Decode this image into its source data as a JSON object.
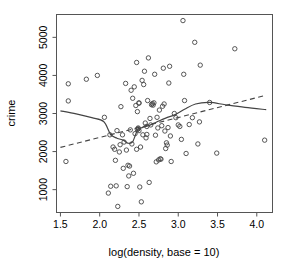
{
  "chart_data": {
    "type": "scatter",
    "title": "",
    "xlabel": "log(density, base = 10)",
    "ylabel": "crime",
    "xlim": [
      1.45,
      4.2
    ],
    "ylim": [
      400,
      5600
    ],
    "xticks": [
      1.5,
      2.0,
      2.5,
      3.0,
      3.5,
      4.0
    ],
    "xtick_labels": [
      "1.5",
      "2.0",
      "2.5",
      "3.0",
      "3.5",
      "4.0"
    ],
    "yticks": [
      1000,
      2000,
      3000,
      4000,
      5000
    ],
    "ytick_labels": [
      "1000",
      "2000",
      "3000",
      "4000",
      "5000"
    ],
    "grid": false,
    "legend": "none",
    "point_marker": "open-circle",
    "point_radius_px": 2.2,
    "points": [
      [
        1.57,
        1740
      ],
      [
        1.6,
        3330
      ],
      [
        1.6,
        3780
      ],
      [
        1.83,
        3900
      ],
      [
        1.97,
        4000
      ],
      [
        2.06,
        2900
      ],
      [
        2.11,
        910
      ],
      [
        2.13,
        2440
      ],
      [
        2.14,
        1090
      ],
      [
        2.17,
        2120
      ],
      [
        2.19,
        2060
      ],
      [
        2.2,
        1770
      ],
      [
        2.21,
        1100
      ],
      [
        2.22,
        2550
      ],
      [
        2.23,
        560
      ],
      [
        2.25,
        1990
      ],
      [
        2.26,
        2180
      ],
      [
        2.27,
        3180
      ],
      [
        2.29,
        2440
      ],
      [
        2.3,
        1560
      ],
      [
        2.31,
        2250
      ],
      [
        2.33,
        3790
      ],
      [
        2.34,
        2040
      ],
      [
        2.35,
        1080
      ],
      [
        2.36,
        1640
      ],
      [
        2.37,
        1360
      ],
      [
        2.38,
        1620
      ],
      [
        2.39,
        2570
      ],
      [
        2.4,
        3610
      ],
      [
        2.41,
        2200
      ],
      [
        2.42,
        3400
      ],
      [
        2.43,
        1430
      ],
      [
        2.44,
        3700
      ],
      [
        2.45,
        2470
      ],
      [
        2.46,
        3210
      ],
      [
        2.47,
        2060
      ],
      [
        2.47,
        4340
      ],
      [
        2.48,
        3050
      ],
      [
        2.48,
        2580
      ],
      [
        2.49,
        2620
      ],
      [
        2.49,
        2600
      ],
      [
        2.5,
        2550
      ],
      [
        2.5,
        3280
      ],
      [
        2.5,
        3270
      ],
      [
        2.51,
        1070
      ],
      [
        2.52,
        2120
      ],
      [
        2.53,
        680
      ],
      [
        2.54,
        3870
      ],
      [
        2.55,
        2440
      ],
      [
        2.56,
        3760
      ],
      [
        2.57,
        4110
      ],
      [
        2.58,
        2750
      ],
      [
        2.59,
        2360
      ],
      [
        2.6,
        2660
      ],
      [
        2.6,
        2450
      ],
      [
        2.61,
        3340
      ],
      [
        2.62,
        4460
      ],
      [
        2.63,
        1190
      ],
      [
        2.64,
        2870
      ],
      [
        2.65,
        2700
      ],
      [
        2.66,
        3230
      ],
      [
        2.67,
        3260
      ],
      [
        2.68,
        3220
      ],
      [
        2.69,
        3280
      ],
      [
        2.7,
        4030
      ],
      [
        2.71,
        2430
      ],
      [
        2.72,
        1730
      ],
      [
        2.73,
        2900
      ],
      [
        2.74,
        2620
      ],
      [
        2.75,
        1780
      ],
      [
        2.76,
        3090
      ],
      [
        2.77,
        1810
      ],
      [
        2.78,
        1800
      ],
      [
        2.79,
        2680
      ],
      [
        2.8,
        3190
      ],
      [
        2.81,
        4190
      ],
      [
        2.82,
        3250
      ],
      [
        2.83,
        2540
      ],
      [
        2.84,
        2080
      ],
      [
        2.85,
        2230
      ],
      [
        2.86,
        2170
      ],
      [
        2.87,
        2630
      ],
      [
        2.88,
        3800
      ],
      [
        2.89,
        4240
      ],
      [
        2.9,
        2410
      ],
      [
        2.91,
        1740
      ],
      [
        2.95,
        3000
      ],
      [
        2.97,
        2890
      ],
      [
        3.0,
        2700
      ],
      [
        3.02,
        2660
      ],
      [
        3.04,
        2320
      ],
      [
        3.06,
        5440
      ],
      [
        3.07,
        4030
      ],
      [
        3.08,
        3340
      ],
      [
        3.1,
        1950
      ],
      [
        3.14,
        2710
      ],
      [
        3.18,
        2890
      ],
      [
        3.21,
        4870
      ],
      [
        3.25,
        2200
      ],
      [
        3.27,
        2780
      ],
      [
        3.28,
        4270
      ],
      [
        3.4,
        3290
      ],
      [
        3.49,
        1960
      ],
      [
        3.72,
        4700
      ],
      [
        4.1,
        2300
      ]
    ],
    "lowess_curve": {
      "style": "solid",
      "points": [
        [
          1.5,
          3070
        ],
        [
          1.7,
          2990
        ],
        [
          1.9,
          2890
        ],
        [
          2.05,
          2790
        ],
        [
          2.14,
          2450
        ],
        [
          2.22,
          2350
        ],
        [
          2.3,
          2300
        ],
        [
          2.36,
          2220
        ],
        [
          2.42,
          2260
        ],
        [
          2.48,
          2560
        ],
        [
          2.54,
          2630
        ],
        [
          2.62,
          2680
        ],
        [
          2.72,
          2770
        ],
        [
          2.84,
          2880
        ],
        [
          2.96,
          2970
        ],
        [
          3.08,
          3110
        ],
        [
          3.22,
          3250
        ],
        [
          3.4,
          3290
        ],
        [
          3.6,
          3230
        ],
        [
          3.85,
          3160
        ],
        [
          4.12,
          3100
        ]
      ]
    },
    "regression_line": {
      "style": "dashed",
      "points": [
        [
          1.5,
          2110
        ],
        [
          4.12,
          3480
        ]
      ]
    }
  },
  "figure": {
    "background": "#ffffff",
    "foreground": "#444444",
    "frame_color": "#555555"
  }
}
